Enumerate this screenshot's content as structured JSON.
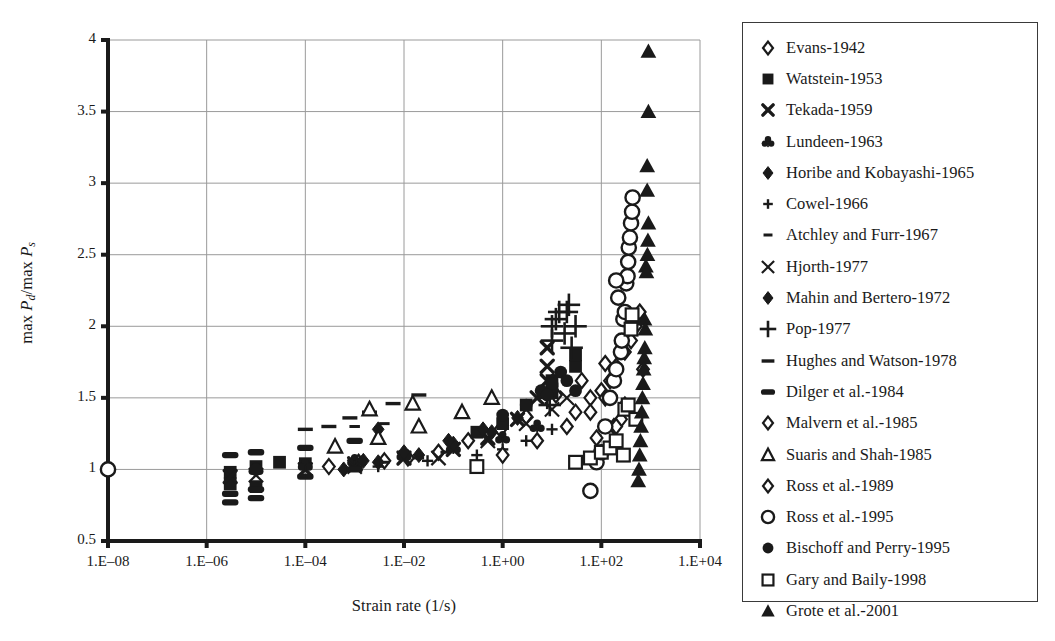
{
  "chart_data": {
    "type": "scatter",
    "title": "",
    "xlabel": "Strain rate (1/s)",
    "ylabel": "max Pd/max Ps",
    "ylabel_parts": {
      "prefix": "max ",
      "num_base": "P",
      "num_sub": "d",
      "sep": "/max ",
      "den_base": "P",
      "den_sub": "s"
    },
    "x_scale": "log",
    "xlim": [
      1e-08,
      10000.0
    ],
    "ylim": [
      0.5,
      4
    ],
    "xticks": [
      "1.E–08",
      "1.E–06",
      "1.E–04",
      "1.E–02",
      "1.E+00",
      "1.E+02",
      "1.E+04"
    ],
    "xtick_values": [
      1e-08,
      1e-06,
      0.0001,
      0.01,
      1,
      100,
      10000
    ],
    "yticks": [
      "0.5",
      "1",
      "1.5",
      "2",
      "2.5",
      "3",
      "3.5",
      "4"
    ],
    "ytick_values": [
      0.5,
      1,
      1.5,
      2,
      2.5,
      3,
      3.5,
      4
    ],
    "grid": true,
    "legend_position": "right-outside",
    "marker_color": "#1a1a1a",
    "grid_color": "#9a9a9a",
    "axis_color": "#1a1a1a",
    "series": [
      {
        "name": "Evans-1942",
        "marker": "open-diamond",
        "points": [
          [
            0.0003,
            1.02
          ],
          [
            0.0012,
            1.05
          ],
          [
            0.004,
            1.06
          ],
          [
            0.012,
            1.08
          ],
          [
            0.05,
            1.12
          ],
          [
            0.2,
            1.2
          ],
          [
            0.9,
            1.28
          ],
          [
            3.0,
            1.37
          ],
          [
            12.0,
            1.52
          ],
          [
            40.0,
            1.62
          ],
          [
            120.0,
            1.74
          ],
          [
            300.0,
            1.9
          ]
        ]
      },
      {
        "name": "Watstein-1953",
        "marker": "filled-square",
        "points": [
          [
            3e-06,
            0.98
          ],
          [
            3e-06,
            0.9
          ],
          [
            1e-05,
            1.02
          ],
          [
            1e-05,
            0.88
          ],
          [
            3e-05,
            1.05
          ],
          [
            0.0001,
            1.04
          ],
          [
            0.3,
            1.26
          ],
          [
            1.0,
            1.32
          ],
          [
            3.0,
            1.45
          ],
          [
            10.0,
            1.55
          ],
          [
            10.0,
            1.62
          ],
          [
            30.0,
            1.72
          ],
          [
            30.0,
            1.8
          ]
        ]
      },
      {
        "name": "Tekada-1959",
        "marker": "bold-x",
        "points": [
          [
            3e-06,
            0.95
          ],
          [
            0.0001,
            1.0
          ],
          [
            0.001,
            1.04
          ],
          [
            0.01,
            1.08
          ],
          [
            0.1,
            1.14
          ],
          [
            0.5,
            1.22
          ],
          [
            2.0,
            1.35
          ],
          [
            5.0,
            1.5
          ],
          [
            8.0,
            1.72
          ],
          [
            8.0,
            1.85
          ],
          [
            8.0,
            1.62
          ]
        ]
      },
      {
        "name": "Lundeen-1963",
        "marker": "filled-club",
        "points": [
          [
            1e-05,
            1.0
          ],
          [
            0.0001,
            1.03
          ],
          [
            0.001,
            1.06
          ],
          [
            0.01,
            1.1
          ],
          [
            0.1,
            1.15
          ],
          [
            1.0,
            1.22
          ],
          [
            5.0,
            1.3
          ]
        ]
      },
      {
        "name": "Horibe and Kobayashi-1965",
        "marker": "filled-diamond",
        "points": [
          [
            0.0006,
            1.0
          ],
          [
            0.003,
            1.05
          ],
          [
            0.02,
            1.1
          ],
          [
            0.1,
            1.18
          ],
          [
            0.6,
            1.26
          ],
          [
            2.0,
            1.36
          ],
          [
            0.003,
            1.28
          ]
        ]
      },
      {
        "name": "Cowel-1966",
        "marker": "small-plus",
        "points": [
          [
            0.003,
            1.02
          ],
          [
            0.03,
            1.06
          ],
          [
            0.3,
            1.1
          ],
          [
            1.0,
            1.14
          ],
          [
            3.0,
            1.2
          ],
          [
            10.0,
            1.28
          ]
        ]
      },
      {
        "name": "Atchley and Furr-1967",
        "marker": "small-dash",
        "points": [
          [
            0.001,
            1.02
          ],
          [
            0.004,
            1.05
          ],
          [
            0.02,
            1.08
          ],
          [
            0.07,
            1.12
          ],
          [
            0.001,
            1.3
          ],
          [
            0.004,
            1.32
          ]
        ]
      },
      {
        "name": "Hjorth-1977",
        "marker": "thin-x",
        "points": [
          [
            1e-05,
            0.96
          ],
          [
            0.001,
            1.02
          ],
          [
            0.05,
            1.08
          ],
          [
            0.5,
            1.2
          ],
          [
            3.0,
            1.32
          ],
          [
            10.0,
            1.42
          ],
          [
            20.0,
            1.5
          ]
        ]
      },
      {
        "name": "Mahin and Bertero-1972",
        "marker": "filled-diamond",
        "points": [
          [
            0.0015,
            1.06
          ],
          [
            0.01,
            1.12
          ],
          [
            0.08,
            1.2
          ],
          [
            0.4,
            1.28
          ]
        ]
      },
      {
        "name": "Pop-1977",
        "marker": "big-plus",
        "points": [
          [
            10.0,
            1.9
          ],
          [
            10.0,
            2.0
          ],
          [
            12.0,
            2.05
          ],
          [
            14.0,
            2.1
          ],
          [
            18.0,
            1.95
          ],
          [
            20.0,
            2.1
          ],
          [
            22.0,
            2.15
          ],
          [
            25.0,
            1.85
          ],
          [
            30.0,
            2.0
          ],
          [
            8.0,
            1.5
          ],
          [
            9.0,
            1.45
          ]
        ]
      },
      {
        "name": "Hughes and Watson-1978",
        "marker": "medium-dash",
        "points": [
          [
            0.0008,
            1.36
          ],
          [
            0.002,
            1.4
          ],
          [
            0.006,
            1.46
          ],
          [
            0.02,
            1.52
          ],
          [
            0.0003,
            1.3
          ],
          [
            0.0001,
            1.28
          ]
        ]
      },
      {
        "name": "Dilger et al.-1984",
        "marker": "thick-dash",
        "points": [
          [
            3e-06,
            1.1
          ],
          [
            3e-06,
            0.83
          ],
          [
            3e-06,
            0.77
          ],
          [
            1e-05,
            1.12
          ],
          [
            1e-05,
            0.86
          ],
          [
            1e-05,
            0.8
          ],
          [
            0.0001,
            1.15
          ],
          [
            0.0001,
            0.95
          ],
          [
            0.001,
            1.2
          ],
          [
            0.001,
            1.0
          ]
        ]
      },
      {
        "name": "Malvern et al.-1985",
        "marker": "open-diamond",
        "points": [
          [
            30.0,
            1.4
          ],
          [
            60.0,
            1.5
          ],
          [
            100.0,
            1.55
          ],
          [
            150.0,
            1.62
          ],
          [
            200.0,
            1.72
          ],
          [
            300.0,
            1.82
          ],
          [
            400.0,
            1.9
          ],
          [
            500.0,
            2.0
          ],
          [
            600.0,
            2.1
          ],
          [
            250.0,
            1.35
          ],
          [
            180.0,
            1.3
          ],
          [
            700.0,
            1.7
          ]
        ]
      },
      {
        "name": "Suaris and Shah-1985",
        "marker": "open-triangle",
        "points": [
          [
            0.0004,
            1.16
          ],
          [
            0.003,
            1.22
          ],
          [
            0.02,
            1.3
          ],
          [
            0.15,
            1.4
          ],
          [
            0.6,
            1.5
          ],
          [
            0.002,
            1.42
          ],
          [
            0.015,
            1.46
          ]
        ]
      },
      {
        "name": "Ross et al.-1989",
        "marker": "open-diamond",
        "points": [
          [
            1.0,
            1.1
          ],
          [
            5.0,
            1.2
          ],
          [
            20.0,
            1.3
          ],
          [
            60.0,
            1.4
          ],
          [
            120.0,
            1.5
          ],
          [
            200.0,
            1.3
          ],
          [
            300.0,
            1.45
          ],
          [
            80.0,
            1.22
          ]
        ]
      },
      {
        "name": "Ross et al.-1995",
        "marker": "open-circle",
        "points": [
          [
            1e-08,
            1.0
          ],
          [
            60.0,
            0.85
          ],
          [
            80.0,
            1.05
          ],
          [
            100.0,
            1.12
          ],
          [
            120.0,
            1.3
          ],
          [
            150.0,
            1.5
          ],
          [
            180.0,
            1.62
          ],
          [
            200.0,
            1.7
          ],
          [
            250.0,
            1.82
          ],
          [
            260.0,
            1.9
          ],
          [
            280.0,
            2.05
          ],
          [
            300.0,
            2.1
          ],
          [
            320.0,
            2.3
          ],
          [
            340.0,
            2.35
          ],
          [
            350.0,
            2.45
          ],
          [
            360.0,
            2.55
          ],
          [
            380.0,
            2.62
          ],
          [
            400.0,
            2.72
          ],
          [
            420.0,
            2.8
          ],
          [
            430.0,
            2.9
          ],
          [
            200.0,
            2.32
          ],
          [
            220.0,
            2.2
          ]
        ]
      },
      {
        "name": "Bischoff and Perry-1995",
        "marker": "filled-circle",
        "points": [
          [
            1e-05,
            1.0
          ],
          [
            1.0,
            1.38
          ],
          [
            3.0,
            1.45
          ],
          [
            6.0,
            1.55
          ],
          [
            10.0,
            1.6
          ],
          [
            15.0,
            1.68
          ],
          [
            20.0,
            1.62
          ],
          [
            8.0,
            1.52
          ],
          [
            30.0,
            1.55
          ]
        ]
      },
      {
        "name": "Gary and Baily-1998",
        "marker": "open-square",
        "points": [
          [
            0.3,
            1.02
          ],
          [
            30.0,
            1.05
          ],
          [
            60.0,
            1.08
          ],
          [
            100.0,
            1.12
          ],
          [
            150.0,
            1.15
          ],
          [
            200.0,
            1.2
          ],
          [
            300.0,
            1.42
          ],
          [
            350.0,
            1.45
          ],
          [
            400.0,
            1.98
          ],
          [
            420.0,
            2.08
          ],
          [
            280.0,
            1.1
          ],
          [
            500.0,
            1.35
          ]
        ]
      },
      {
        "name": "Grote et al.-2001",
        "marker": "filled-triangle",
        "points": [
          [
            900.0,
            3.92
          ],
          [
            900.0,
            3.5
          ],
          [
            850.0,
            3.12
          ],
          [
            850.0,
            2.95
          ],
          [
            900.0,
            2.72
          ],
          [
            800.0,
            2.42
          ],
          [
            820.0,
            2.38
          ],
          [
            750.0,
            2.05
          ],
          [
            780.0,
            1.98
          ],
          [
            760.0,
            1.85
          ],
          [
            740.0,
            1.78
          ],
          [
            720.0,
            1.7
          ],
          [
            700.0,
            1.6
          ],
          [
            680.0,
            1.5
          ],
          [
            660.0,
            1.4
          ],
          [
            640.0,
            1.3
          ],
          [
            620.0,
            1.2
          ],
          [
            600.0,
            1.1
          ],
          [
            580.0,
            1.0
          ],
          [
            560.0,
            0.92
          ],
          [
            880.0,
            2.6
          ],
          [
            860.0,
            2.5
          ]
        ]
      }
    ]
  },
  "legend": {
    "items": [
      {
        "label": "Evans-1942",
        "marker": "open-diamond"
      },
      {
        "label": "Watstein-1953",
        "marker": "filled-square"
      },
      {
        "label": "Tekada-1959",
        "marker": "bold-x"
      },
      {
        "label": "Lundeen-1963",
        "marker": "filled-club"
      },
      {
        "label": "Horibe and Kobayashi-1965",
        "marker": "filled-diamond"
      },
      {
        "label": "Cowel-1966",
        "marker": "small-plus"
      },
      {
        "label": "Atchley and Furr-1967",
        "marker": "small-dash"
      },
      {
        "label": "Hjorth-1977",
        "marker": "thin-x"
      },
      {
        "label": "Mahin and Bertero-1972",
        "marker": "filled-diamond"
      },
      {
        "label": "Pop-1977",
        "marker": "big-plus"
      },
      {
        "label": "Hughes and Watson-1978",
        "marker": "medium-dash"
      },
      {
        "label": "Dilger et al.-1984",
        "marker": "thick-dash"
      },
      {
        "label": "Malvern et al.-1985",
        "marker": "open-diamond"
      },
      {
        "label": "Suaris and Shah-1985",
        "marker": "open-triangle"
      },
      {
        "label": "Ross et al.-1989",
        "marker": "open-diamond"
      },
      {
        "label": "Ross et al.-1995",
        "marker": "open-circle"
      },
      {
        "label": "Bischoff and Perry-1995",
        "marker": "filled-circle"
      },
      {
        "label": "Gary and Baily-1998",
        "marker": "open-square"
      },
      {
        "label": "Grote et al.-2001",
        "marker": "filled-triangle"
      }
    ]
  }
}
